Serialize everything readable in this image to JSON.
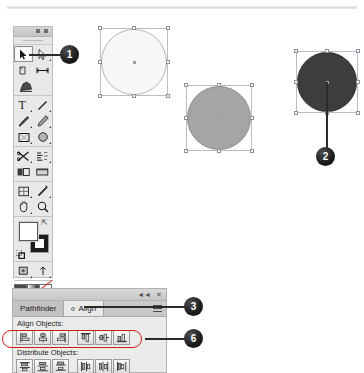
{
  "app": {
    "name": "Adobe Illustrator",
    "document_rule": "horizontal-ruler"
  },
  "tools_panel": {
    "title": "Tools",
    "collapse_label": "◄◄",
    "close_label": "✕",
    "groups": [
      {
        "name": "selection-tools",
        "tools": [
          {
            "id": "selection",
            "label": "Selection Tool",
            "icon": "arrow-pointer-icon",
            "selected": true
          },
          {
            "id": "direct-selection",
            "label": "Direct Selection Tool",
            "icon": "white-arrow-icon",
            "selected": false
          },
          {
            "id": "magic-wand",
            "label": "Magic Wand Tool",
            "icon": "magic-wand-icon",
            "selected": false
          },
          {
            "id": "lasso",
            "label": "Lasso Tool",
            "icon": "lasso-icon",
            "selected": false
          },
          {
            "id": "pen",
            "label": "Pen Tool",
            "icon": "pen-nib-icon",
            "selected": false
          }
        ]
      },
      {
        "name": "drawing-tools",
        "tools": [
          {
            "id": "type",
            "label": "Type Tool",
            "icon": "type-t-icon",
            "selected": false
          },
          {
            "id": "line-segment",
            "label": "Line Segment Tool",
            "icon": "line-icon",
            "selected": false
          },
          {
            "id": "rectangle",
            "label": "Rectangle Tool",
            "icon": "rectangle-icon",
            "selected": false
          },
          {
            "id": "paintbrush",
            "label": "Paintbrush Tool",
            "icon": "paintbrush-icon",
            "selected": false
          },
          {
            "id": "pencil",
            "label": "Pencil Tool",
            "icon": "pencil-icon",
            "selected": false
          },
          {
            "id": "blob-brush",
            "label": "Blob Brush Tool",
            "icon": "blob-brush-icon",
            "selected": false
          }
        ]
      },
      {
        "name": "transform-tools",
        "tools": [
          {
            "id": "rotate",
            "label": "Rotate Tool",
            "icon": "rotate-icon",
            "selected": false
          },
          {
            "id": "scale",
            "label": "Scale Tool",
            "icon": "scale-icon",
            "selected": false
          },
          {
            "id": "width",
            "label": "Width Tool",
            "icon": "width-icon",
            "selected": false
          },
          {
            "id": "free-transform",
            "label": "Free Transform Tool",
            "icon": "free-transform-icon",
            "selected": false
          },
          {
            "id": "shape-builder",
            "label": "Shape Builder Tool",
            "icon": "shape-builder-icon",
            "selected": false
          },
          {
            "id": "perspective-grid",
            "label": "Perspective Grid Tool",
            "icon": "perspective-grid-icon",
            "selected": false
          }
        ]
      },
      {
        "name": "utility-tools",
        "tools": [
          {
            "id": "mesh",
            "label": "Mesh Tool",
            "icon": "mesh-icon",
            "selected": false
          },
          {
            "id": "gradient",
            "label": "Gradient Tool",
            "icon": "gradient-icon",
            "selected": false
          },
          {
            "id": "eyedropper",
            "label": "Eyedropper Tool",
            "icon": "eyedropper-icon",
            "selected": false
          },
          {
            "id": "blend",
            "label": "Blend Tool",
            "icon": "blend-icon",
            "selected": false
          },
          {
            "id": "symbol-sprayer",
            "label": "Symbol Sprayer Tool",
            "icon": "symbol-sprayer-icon",
            "selected": false
          },
          {
            "id": "column-graph",
            "label": "Column Graph Tool",
            "icon": "bar-graph-icon",
            "selected": false
          }
        ]
      },
      {
        "name": "view-tools",
        "tools": [
          {
            "id": "artboard",
            "label": "Artboard Tool",
            "icon": "artboard-icon",
            "selected": false
          },
          {
            "id": "slice",
            "label": "Slice Tool",
            "icon": "slice-icon",
            "selected": false
          },
          {
            "id": "hand",
            "label": "Hand Tool",
            "icon": "hand-icon",
            "selected": false
          },
          {
            "id": "zoom",
            "label": "Zoom Tool",
            "icon": "magnifier-icon",
            "selected": false
          }
        ]
      }
    ],
    "fill_stroke": {
      "fill_label": "Fill",
      "fill_color": "#ffffff",
      "stroke_label": "Stroke",
      "stroke_color": "#1c1c1c",
      "swap_label": "Swap Fill and Stroke",
      "default_label": "Default Fill and Stroke",
      "help_glyph": "?"
    },
    "color_modes": [
      {
        "id": "color",
        "label": "Color",
        "icon": "color-swatch-icon"
      },
      {
        "id": "gradient",
        "label": "Gradient",
        "icon": "gradient-swatch-icon"
      },
      {
        "id": "none",
        "label": "None",
        "icon": "none-swatch-icon"
      }
    ],
    "screen_modes": [
      {
        "id": "draw-normal",
        "label": "Draw Normal",
        "icon": "draw-normal-icon"
      },
      {
        "id": "draw-behind",
        "label": "Draw Behind",
        "icon": "draw-behind-icon"
      },
      {
        "id": "screen-mode",
        "label": "Change Screen Mode",
        "icon": "screen-mode-icon"
      }
    ]
  },
  "canvas": {
    "shapes": [
      {
        "id": "circle-light",
        "name": "light-circle",
        "fill": "#f7f7f7",
        "stroke": "#b6b6b6",
        "selected": true,
        "x": 100,
        "y": 28,
        "size": 68
      },
      {
        "id": "circle-gray",
        "name": "gray-circle",
        "fill": "#a5a5a5",
        "stroke": "#8e8e8e",
        "selected": true,
        "x": 186,
        "y": 85,
        "size": 66
      },
      {
        "id": "circle-dark",
        "name": "dark-circle",
        "fill": "#3d3d3d",
        "stroke": "#2e2e2e",
        "selected": true,
        "x": 296,
        "y": 51,
        "size": 62
      }
    ]
  },
  "callouts": [
    {
      "id": "callout-1",
      "number": "1",
      "x": 60,
      "y": 46,
      "target": "selection-tool"
    },
    {
      "id": "callout-2",
      "number": "2",
      "x": 316,
      "y": 148,
      "target": "dark-circle"
    },
    {
      "id": "callout-3",
      "number": "3",
      "x": 184,
      "y": 298,
      "target": "align-tab"
    },
    {
      "id": "callout-6",
      "number": "6",
      "x": 184,
      "y": 330,
      "target": "align-objects-row"
    }
  ],
  "align_panel": {
    "collapse_label": "◄◄",
    "close_label": "✕",
    "menu_label": "Panel Menu",
    "tabs": [
      {
        "id": "pathfinder",
        "label": "Pathfinder",
        "active": false
      },
      {
        "id": "align",
        "label": "Align",
        "active": true
      }
    ],
    "sections": [
      {
        "id": "align-objects",
        "label": "Align Objects:",
        "buttons": [
          {
            "id": "horizontal-align-left",
            "label": "Horizontal Align Left",
            "icon": "align-left-icon"
          },
          {
            "id": "horizontal-align-center",
            "label": "Horizontal Align Center",
            "icon": "align-hcenter-icon"
          },
          {
            "id": "horizontal-align-right",
            "label": "Horizontal Align Right",
            "icon": "align-right-icon"
          },
          {
            "id": "vertical-align-top",
            "label": "Vertical Align Top",
            "icon": "align-top-icon"
          },
          {
            "id": "vertical-align-center",
            "label": "Vertical Align Center",
            "icon": "align-vcenter-icon"
          },
          {
            "id": "vertical-align-bottom",
            "label": "Vertical Align Bottom",
            "icon": "align-bottom-icon"
          }
        ],
        "highlighted": true,
        "highlight_color": "#d11b1b"
      },
      {
        "id": "distribute-objects",
        "label": "Distribute Objects:",
        "buttons": [
          {
            "id": "vertical-distribute-top",
            "label": "Vertical Distribute Top",
            "icon": "distribute-top-icon"
          },
          {
            "id": "vertical-distribute-center",
            "label": "Vertical Distribute Center",
            "icon": "distribute-vcenter-icon"
          },
          {
            "id": "vertical-distribute-bottom",
            "label": "Vertical Distribute Bottom",
            "icon": "distribute-bottom-icon"
          },
          {
            "id": "horizontal-distribute-left",
            "label": "Horizontal Distribute Left",
            "icon": "distribute-left-icon"
          },
          {
            "id": "horizontal-distribute-center",
            "label": "Horizontal Distribute Center",
            "icon": "distribute-hcenter-icon"
          },
          {
            "id": "horizontal-distribute-right",
            "label": "Horizontal Distribute Right",
            "icon": "distribute-right-icon"
          }
        ],
        "highlighted": false
      }
    ]
  }
}
